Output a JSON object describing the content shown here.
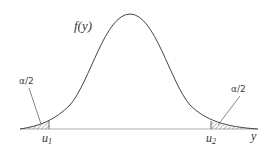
{
  "diagram": {
    "curve_label": "f(y)",
    "left_tail_label": "α/2",
    "right_tail_label": "α/2",
    "left_critical": "u",
    "left_critical_sub": "1",
    "right_critical": "u",
    "right_critical_sub": "2",
    "axis_label": "y"
  }
}
